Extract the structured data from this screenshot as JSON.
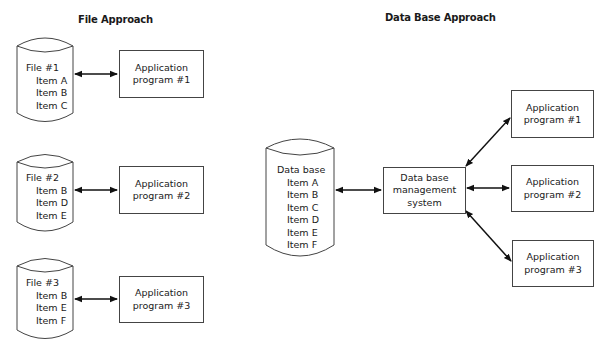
{
  "titles": {
    "left": "File Approach",
    "right": "Data Base Approach"
  },
  "file_approach": {
    "files": [
      {
        "name": "File #1",
        "items": [
          "Item A",
          "Item B",
          "Item C"
        ],
        "program": [
          "Application",
          "program #1"
        ]
      },
      {
        "name": "File #2",
        "items": [
          "Item B",
          "Item D",
          "Item E"
        ],
        "program": [
          "Application",
          "program #2"
        ]
      },
      {
        "name": "File #3",
        "items": [
          "Item B",
          "Item E",
          "Item F"
        ],
        "program": [
          "Application",
          "program #3"
        ]
      }
    ]
  },
  "database_approach": {
    "database": {
      "name": "Data base",
      "items": [
        "Item A",
        "Item B",
        "Item C",
        "Item D",
        "Item E",
        "Item F"
      ]
    },
    "dbms": [
      "Data base",
      "management",
      "system"
    ],
    "programs": [
      [
        "Application",
        "program #1"
      ],
      [
        "Application",
        "program #2"
      ],
      [
        "Application",
        "program #3"
      ]
    ]
  },
  "colors": {
    "stroke": "#444444",
    "text": "#1a1a1a",
    "background": "#ffffff"
  }
}
